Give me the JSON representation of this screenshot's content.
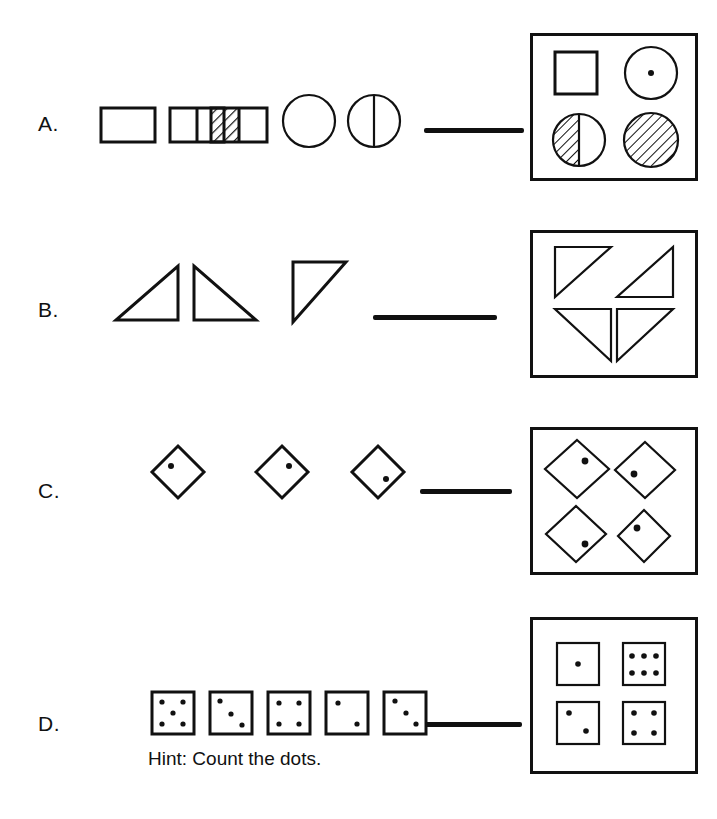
{
  "page": {
    "width": 717,
    "height": 819,
    "background": "#ffffff",
    "ink_color": "#111111"
  },
  "hint": {
    "text": "Hint: Count the dots."
  },
  "rows": [
    {
      "label": "A.",
      "label_pos": {
        "x": 38,
        "y": 112
      },
      "sequence_name": "row-a-sequence",
      "answer_line": {
        "x": 424,
        "y": 128,
        "width": 100,
        "height": 5
      },
      "answer_box": {
        "x": 530,
        "y": 33,
        "width": 168,
        "height": 148
      },
      "sequence_items": [
        {
          "name": "rectangle-plain",
          "kind": "rect",
          "divided": false,
          "shaded": "none"
        },
        {
          "name": "rectangle-halved",
          "kind": "rect",
          "divided": true,
          "shaded": "none"
        },
        {
          "name": "rectangle-half-hatched",
          "kind": "rect",
          "divided": true,
          "shaded": "left-half"
        },
        {
          "name": "circle-plain",
          "kind": "circle",
          "divided": false,
          "shaded": "none"
        },
        {
          "name": "circle-halved",
          "kind": "circle",
          "divided": true,
          "shaded": "none"
        }
      ],
      "answer_items": [
        {
          "name": "square-plain",
          "kind": "square",
          "fill": "none",
          "dots": 0
        },
        {
          "name": "circle-with-dot",
          "kind": "circle",
          "fill": "none",
          "dots": 1
        },
        {
          "name": "circle-left-half-hatched",
          "kind": "circle",
          "fill": "left-half-hatched",
          "dots": 0
        },
        {
          "name": "circle-fully-hatched",
          "kind": "circle",
          "fill": "full-hatched",
          "dots": 0
        }
      ]
    },
    {
      "label": "B.",
      "label_pos": {
        "x": 38,
        "y": 298
      },
      "sequence_name": "row-b-sequence",
      "answer_line": {
        "x": 373,
        "y": 315,
        "width": 124,
        "height": 5
      },
      "answer_box": {
        "x": 530,
        "y": 230,
        "width": 168,
        "height": 148
      },
      "sequence_items": [
        {
          "name": "triangle-right-angle-bottom-right",
          "kind": "triangle",
          "right_angle": "bottom-right"
        },
        {
          "name": "triangle-right-angle-bottom-left",
          "kind": "triangle",
          "right_angle": "bottom-left"
        },
        {
          "name": "triangle-right-angle-top-left",
          "kind": "triangle",
          "right_angle": "top-left"
        }
      ],
      "answer_items": [
        {
          "name": "triangle-right-angle-top-left",
          "kind": "triangle",
          "right_angle": "top-left"
        },
        {
          "name": "triangle-right-angle-top-right",
          "kind": "triangle",
          "right_angle": "top-right"
        },
        {
          "name": "triangle-right-angle-top-right",
          "kind": "triangle",
          "right_angle": "top-right"
        },
        {
          "name": "triangle-right-angle-top-left",
          "kind": "triangle",
          "right_angle": "top-left"
        }
      ]
    },
    {
      "label": "C.",
      "label_pos": {
        "x": 38,
        "y": 479
      },
      "sequence_name": "row-c-sequence",
      "answer_line": {
        "x": 420,
        "y": 489,
        "width": 92,
        "height": 5
      },
      "answer_box": {
        "x": 530,
        "y": 427,
        "width": 168,
        "height": 148
      },
      "sequence_items": [
        {
          "name": "diamond-dot-upper-left",
          "kind": "diamond",
          "dot_position": "upper-left"
        },
        {
          "name": "diamond-dot-upper-right",
          "kind": "diamond",
          "dot_position": "upper-right"
        },
        {
          "name": "diamond-dot-lower-right",
          "kind": "diamond",
          "dot_position": "lower-right"
        }
      ],
      "answer_items": [
        {
          "name": "diamond-dot-upper-right",
          "kind": "diamond",
          "dot_position": "upper-right"
        },
        {
          "name": "diamond-dot-left",
          "kind": "diamond",
          "dot_position": "lower-left"
        },
        {
          "name": "diamond-dot-lower-right",
          "kind": "diamond",
          "dot_position": "lower-right"
        },
        {
          "name": "diamond-dot-upper-left",
          "kind": "diamond",
          "dot_position": "upper-left"
        }
      ]
    },
    {
      "label": "D.",
      "label_pos": {
        "x": 38,
        "y": 712
      },
      "sequence_name": "row-d-sequence",
      "answer_line": {
        "x": 425,
        "y": 722,
        "width": 97,
        "height": 5
      },
      "answer_box": {
        "x": 530,
        "y": 617,
        "width": 168,
        "height": 157
      },
      "sequence_items": [
        {
          "name": "dot-square-5",
          "kind": "dot-square",
          "dot_count": 5,
          "pattern": "five-quincunx"
        },
        {
          "name": "dot-square-3",
          "kind": "dot-square",
          "dot_count": 3,
          "pattern": "diagonal"
        },
        {
          "name": "dot-square-4",
          "kind": "dot-square",
          "dot_count": 4,
          "pattern": "corners"
        },
        {
          "name": "dot-square-2",
          "kind": "dot-square",
          "dot_count": 2,
          "pattern": "diagonal"
        },
        {
          "name": "dot-square-3",
          "kind": "dot-square",
          "dot_count": 3,
          "pattern": "diagonal"
        }
      ],
      "answer_items": [
        {
          "name": "dot-square-1",
          "kind": "dot-square",
          "dot_count": 1,
          "pattern": "center"
        },
        {
          "name": "dot-square-6",
          "kind": "dot-square",
          "dot_count": 6,
          "pattern": "two-rows-of-three"
        },
        {
          "name": "dot-square-2",
          "kind": "dot-square",
          "dot_count": 2,
          "pattern": "diagonal"
        },
        {
          "name": "dot-square-4",
          "kind": "dot-square",
          "dot_count": 4,
          "pattern": "corners"
        }
      ]
    }
  ]
}
